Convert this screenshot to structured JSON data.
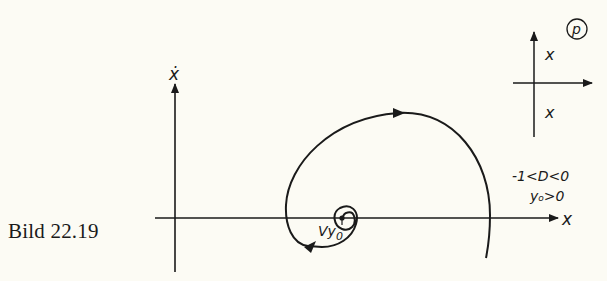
{
  "figure": {
    "caption": "Bild 22.19",
    "main_plot": {
      "x_axis_label": "x",
      "y_axis_label": "ẋ",
      "trajectory_label": "Vy₀",
      "trajectory_label_main": "Vy",
      "trajectory_label_sub": "0",
      "condition_line_1": "-1<D<0",
      "condition_line_2": "y₀>0",
      "condition_line_2_main": "y",
      "condition_line_2_sub": "o",
      "condition_line_2_rest": ">0",
      "trajectory_type": "unstable spiral (focus) diverging outward, clockwise",
      "equilibrium_point": "Vy₀ on x-axis"
    },
    "pole_plot": {
      "label": "p",
      "poles": [
        {
          "marker": "x",
          "position": "upper half-plane, right of imaginary axis"
        },
        {
          "marker": "x",
          "position": "lower half-plane, right of imaginary axis"
        }
      ]
    }
  },
  "colors": {
    "background": "#fcfbf4",
    "ink": "#1a1a1a"
  }
}
